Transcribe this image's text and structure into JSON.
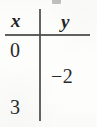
{
  "figure": {
    "kind": "two-column value table",
    "headers": {
      "x": "x",
      "y": "y"
    },
    "rows": [
      {
        "x": "0",
        "y": ""
      },
      {
        "x": "",
        "y": "−2"
      },
      {
        "x": "3",
        "y": ""
      }
    ],
    "artifact_label": ""
  },
  "chart_data": {
    "type": "table",
    "title": "",
    "columns": [
      "x",
      "y"
    ],
    "rows": [
      [
        "0",
        ""
      ],
      [
        "",
        "-2"
      ],
      [
        "3",
        ""
      ]
    ],
    "x_values": [
      0,
      3
    ],
    "y_values": [
      -2
    ],
    "grid": true,
    "legend": "none"
  },
  "style": {
    "ink_color": "#2b2b2b",
    "rule_color": "#4a4a4a",
    "paper_color": "#fdfdfc"
  }
}
